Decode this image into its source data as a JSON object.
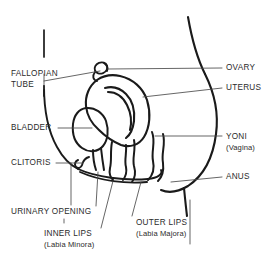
{
  "diagram": {
    "style": {
      "background": "#ffffff",
      "outline_color": "#1a1a1a",
      "leader_color": "#4a4a4a",
      "text_color": "#2b2b2b"
    }
  },
  "labels": {
    "fallopian_tube": {
      "line1": "FALLOPIAN",
      "line2": "TUBE"
    },
    "bladder": {
      "line1": "BLADDER"
    },
    "clitoris": {
      "line1": "CLITORIS"
    },
    "urinary_opening": {
      "line1": "URINARY OPENING"
    },
    "inner_lips": {
      "line1": "INNER LIPS",
      "line2": "(Labia Minora)"
    },
    "outer_lips": {
      "line1": "OUTER LIPS",
      "line2": "(Labia Majora)"
    },
    "ovary": {
      "line1": "OVARY"
    },
    "uterus": {
      "line1": "UTERUS"
    },
    "yoni": {
      "line1": "YONI",
      "line2": "(Vagina)"
    },
    "anus": {
      "line1": "ANUS"
    }
  }
}
